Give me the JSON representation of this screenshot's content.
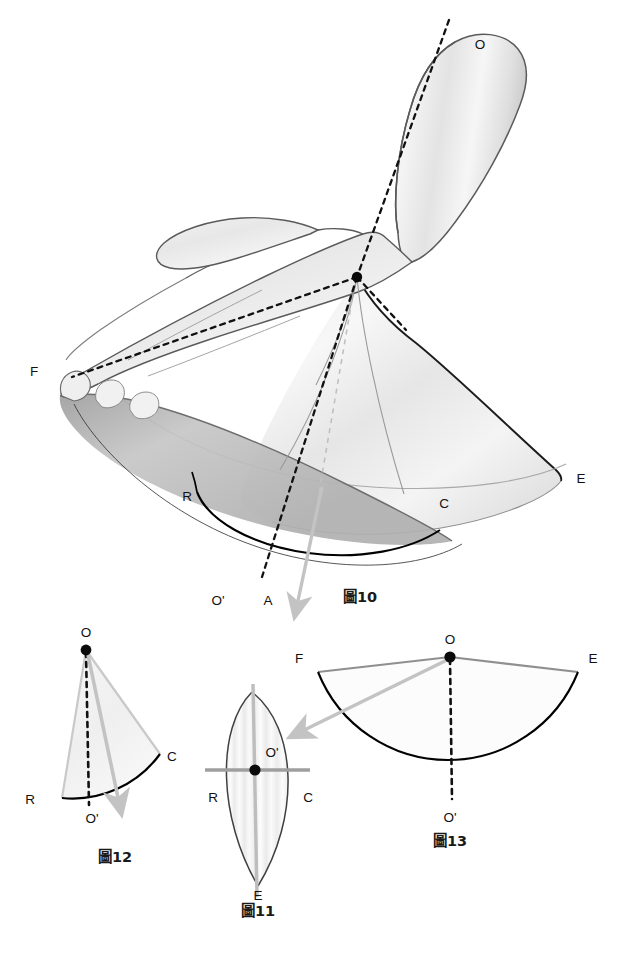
{
  "page": {
    "background": "#ffffff",
    "page_number": ""
  },
  "palette": {
    "ink": "#111111",
    "outline": "#555555",
    "cone_edge": "#7a7a7a",
    "arc_dark": "#000000",
    "gray_arrow": "#bdbdbd",
    "gray_line": "#a8a8a8",
    "skin_light": "#f2f2f2",
    "skin_mid": "#dcdcdc",
    "skin_dark": "#b4b4b4",
    "dashed": "#111111"
  },
  "figures": [
    {
      "id": "fig10",
      "caption": "圖10",
      "caption_pos": [
        360,
        598
      ],
      "description": "Hand and forearm with circumduction cone, apex at O",
      "points": [
        {
          "key": "O",
          "label": "O",
          "x": 480,
          "y": 45,
          "dot": false
        },
        {
          "key": "Oc",
          "label": "",
          "x": 357,
          "y": 277,
          "dot": true
        },
        {
          "key": "F",
          "label": "F",
          "x": 34,
          "y": 372,
          "dot": false
        },
        {
          "key": "E",
          "label": "E",
          "x": 581,
          "y": 479,
          "dot": false
        },
        {
          "key": "R",
          "label": "R",
          "x": 187,
          "y": 497,
          "dot": false
        },
        {
          "key": "C",
          "label": "C",
          "x": 444,
          "y": 504,
          "dot": false
        },
        {
          "key": "Op",
          "label": "O'",
          "x": 218,
          "y": 601,
          "dot": false
        },
        {
          "key": "A",
          "label": "A",
          "x": 268,
          "y": 601,
          "dot": false
        }
      ]
    },
    {
      "id": "fig12",
      "caption": "圖12",
      "caption_pos": [
        115,
        858
      ],
      "description": "Sector O-R-C with dashed axis to O' and gray motion arrow",
      "points": [
        {
          "key": "O",
          "label": "O",
          "x": 86,
          "y": 650,
          "dot": true
        },
        {
          "key": "C",
          "label": "C",
          "x": 162,
          "y": 757,
          "dot": false
        },
        {
          "key": "R",
          "label": "R",
          "x": 27,
          "y": 800,
          "dot": false
        },
        {
          "key": "Op",
          "label": "O'",
          "x": 92,
          "y": 819,
          "dot": false
        }
      ]
    },
    {
      "id": "fig11",
      "caption": "圖11",
      "caption_pos": [
        258,
        912
      ],
      "description": "Lens (vesica) cross-section with crossed gray axes at O'",
      "points": [
        {
          "key": "Op",
          "label": "O'",
          "x": 272,
          "y": 770,
          "dot": true
        },
        {
          "key": "R",
          "label": "R",
          "x": 215,
          "y": 798,
          "dot": false
        },
        {
          "key": "C",
          "label": "C",
          "x": 307,
          "y": 798,
          "dot": false
        },
        {
          "key": "E",
          "label": "E",
          "x": 258,
          "y": 896,
          "dot": false
        }
      ]
    },
    {
      "id": "fig13",
      "caption": "圖13",
      "caption_pos": [
        450,
        842
      ],
      "description": "Sector F-O-E with dashed axis to O' and gray arrow toward 圖11",
      "points": [
        {
          "key": "O",
          "label": "O",
          "x": 450,
          "y": 643,
          "dot": true
        },
        {
          "key": "F",
          "label": "F",
          "x": 299,
          "y": 659,
          "dot": false
        },
        {
          "key": "E",
          "label": "E",
          "x": 593,
          "y": 659,
          "dot": false
        },
        {
          "key": "Op",
          "label": "O'",
          "x": 450,
          "y": 818,
          "dot": false
        }
      ]
    }
  ]
}
